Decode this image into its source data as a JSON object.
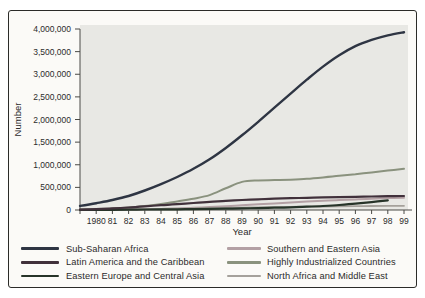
{
  "figure": {
    "background": "#fbfaf7",
    "border_color": "#2b2b28",
    "plot_background": "#e8e8e4",
    "axis_color": "#4a4a46",
    "text_color": "#2b2b2b"
  },
  "chart_data": {
    "type": "line",
    "title": "",
    "xlabel": "Year",
    "ylabel": "Number",
    "grid": false,
    "legend_position": "bottom",
    "x": [
      1979,
      1980,
      1981,
      1982,
      1983,
      1984,
      1985,
      1986,
      1987,
      1988,
      1989,
      1990,
      1991,
      1992,
      1993,
      1994,
      1995,
      1996,
      1997,
      1998,
      1999
    ],
    "x_tick_labels": [
      "1980",
      "81",
      "82",
      "83",
      "84",
      "85",
      "86",
      "87",
      "88",
      "89",
      "90",
      "91",
      "92",
      "93",
      "94",
      "95",
      "96",
      "97",
      "98",
      "99"
    ],
    "ylim": [
      0,
      4000000
    ],
    "y_tick_values": [
      0,
      500000,
      1000000,
      1500000,
      2000000,
      2500000,
      3000000,
      3500000,
      4000000
    ],
    "y_tick_labels": [
      "0",
      "500,000",
      "1,000,000",
      "1,500,000",
      "2,000,000",
      "2,500,000",
      "3,000,000",
      "3,500,000",
      "4,000,000"
    ],
    "series": [
      {
        "name": "Sub-Saharan Africa",
        "color": "#2e3543",
        "width": 2.4,
        "values": [
          90000,
          150000,
          220000,
          310000,
          430000,
          570000,
          730000,
          910000,
          1120000,
          1370000,
          1650000,
          1950000,
          2260000,
          2570000,
          2880000,
          3170000,
          3420000,
          3620000,
          3760000,
          3860000,
          3930000
        ]
      },
      {
        "name": "Latin America and the Caribbean",
        "color": "#41313b",
        "width": 2.2,
        "values": [
          10000,
          20000,
          35000,
          55000,
          80000,
          105000,
          130000,
          155000,
          180000,
          200000,
          220000,
          235000,
          250000,
          260000,
          270000,
          278000,
          285000,
          292000,
          298000,
          305000,
          310000
        ]
      },
      {
        "name": "Eastern Europe and Central Asia",
        "color": "#273429",
        "width": 2.2,
        "values": [
          2000,
          3000,
          5000,
          7000,
          10000,
          13000,
          16000,
          20000,
          25000,
          30000,
          36000,
          42000,
          50000,
          60000,
          72000,
          88000,
          110000,
          140000,
          175000,
          215000,
          null
        ]
      },
      {
        "name": "Southern and Eastern Asia",
        "color": "#b3a0a4",
        "width": 2,
        "values": [
          2000,
          5000,
          8000,
          12000,
          18000,
          25000,
          35000,
          50000,
          65000,
          85000,
          105000,
          125000,
          145000,
          165000,
          185000,
          205000,
          220000,
          235000,
          250000,
          262000,
          272000
        ]
      },
      {
        "name": "Highly Industrialized Countries",
        "color": "#8a927e",
        "width": 2,
        "values": [
          5000,
          15000,
          30000,
          55000,
          90000,
          135000,
          190000,
          250000,
          330000,
          480000,
          620000,
          655000,
          660000,
          668000,
          690000,
          720000,
          755000,
          790000,
          830000,
          870000,
          910000
        ]
      },
      {
        "name": "North Africa and Middle East",
        "color": "#a5a19b",
        "width": 1.8,
        "values": [
          3000,
          6000,
          10000,
          14000,
          19000,
          24000,
          30000,
          36000,
          42000,
          48000,
          54000,
          60000,
          65000,
          70000,
          74000,
          78000,
          82000,
          85000,
          88000,
          90000,
          92000
        ]
      }
    ]
  }
}
